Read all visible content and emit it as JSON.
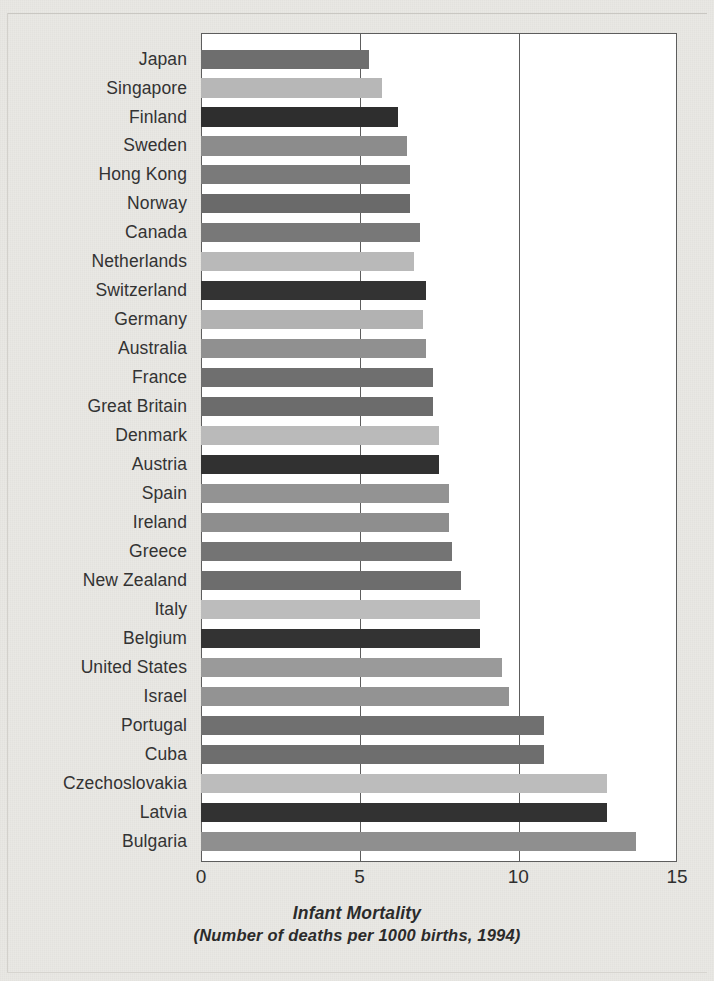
{
  "chart_data": {
    "type": "bar",
    "orientation": "horizontal",
    "title": "Infant Mortality",
    "subtitle": "(Number of deaths per 1000 births, 1994)",
    "xlabel": "",
    "ylabel": "",
    "xlim": [
      0,
      15
    ],
    "ylim": null,
    "grid": true,
    "gridlines": [
      5,
      10
    ],
    "legend": null,
    "xticks": [
      "0",
      "5",
      "10",
      "15"
    ],
    "xtick_values": [
      0,
      5,
      10,
      15
    ],
    "categories": [
      "Japan",
      "Singapore",
      "Finland",
      "Sweden",
      "Hong Kong",
      "Norway",
      "Canada",
      "Netherlands",
      "Switzerland",
      "Germany",
      "Australia",
      "France",
      "Great Britain",
      "Denmark",
      "Austria",
      "Spain",
      "Ireland",
      "Greece",
      "New Zealand",
      "Italy",
      "Belgium",
      "United States",
      "Israel",
      "Portugal",
      "Cuba",
      "Czechoslovakia",
      "Latvia",
      "Bulgaria"
    ],
    "values": [
      5.3,
      5.7,
      6.2,
      6.5,
      6.6,
      6.6,
      6.9,
      6.7,
      7.1,
      7.0,
      7.1,
      7.3,
      7.3,
      7.5,
      7.5,
      7.8,
      7.8,
      7.9,
      8.2,
      8.8,
      8.8,
      9.5,
      9.7,
      10.8,
      10.8,
      12.8,
      12.8,
      13.7
    ],
    "bar_colors": [
      "#6e6e6e",
      "#b7b7b7",
      "#2e2e2e",
      "#8c8c8c",
      "#7a7a7a",
      "#6a6a6a",
      "#787878",
      "#b9b9b9",
      "#333333",
      "#b2b2b2",
      "#909090",
      "#6f6f6f",
      "#6c6c6c",
      "#bababa",
      "#313131",
      "#939393",
      "#8e8e8e",
      "#747474",
      "#6d6d6d",
      "#bcbcbc",
      "#333333",
      "#9a9a9a",
      "#939393",
      "#707070",
      "#6e6e6e",
      "#bcbcbc",
      "#323232",
      "#8f8f8f"
    ]
  },
  "colors": {
    "page_background": "#e9e8e4",
    "plot_background": "#ffffff",
    "axis": "#5d5d5d",
    "text": "#333333",
    "caption_text": "#2b2b2b"
  }
}
